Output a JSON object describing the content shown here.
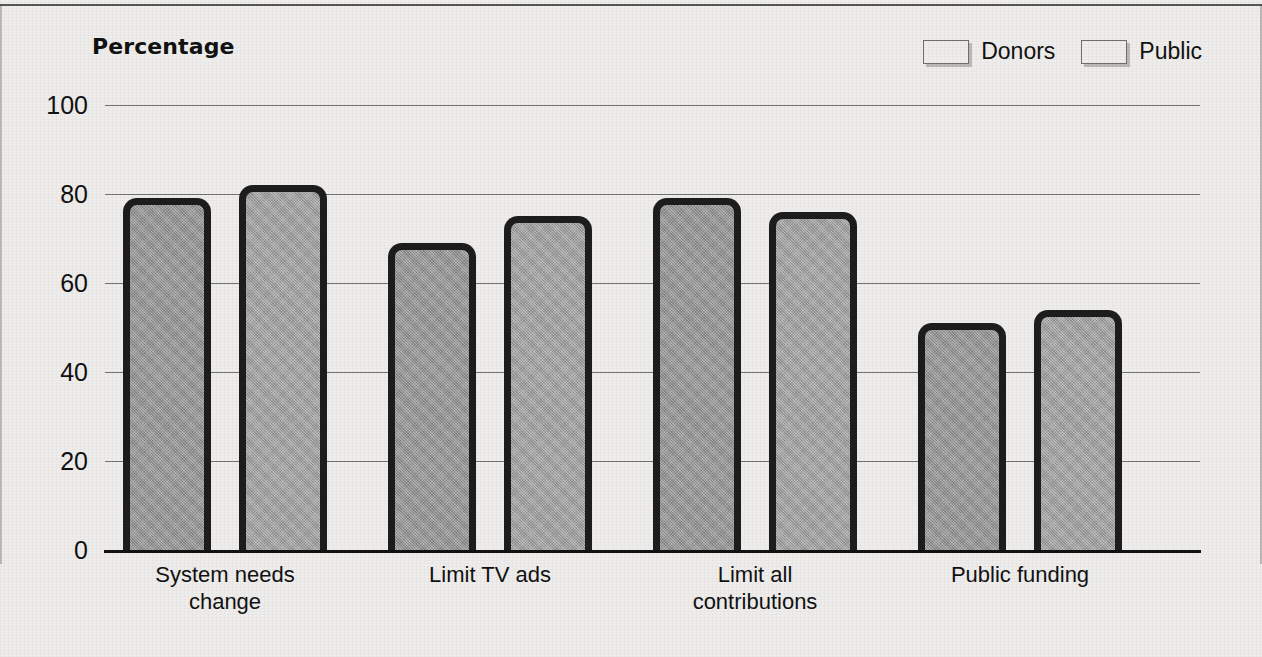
{
  "chart_data": {
    "type": "bar",
    "title": "",
    "ylabel": "Percentage",
    "xlabel": "",
    "ylim": [
      0,
      100
    ],
    "yticks": [
      "0",
      "20",
      "40",
      "60",
      "80",
      "100"
    ],
    "grid": true,
    "legend_position": "top-right",
    "categories": [
      "System needs\nchange",
      "Limit TV ads",
      "Limit all\ncontributions",
      "Public funding"
    ],
    "category_lines": [
      [
        "System needs",
        "change"
      ],
      [
        "Limit TV ads",
        ""
      ],
      [
        "Limit all",
        "contributions"
      ],
      [
        "Public funding",
        ""
      ]
    ],
    "series": [
      {
        "name": "Donors",
        "color": "#9b9b9b",
        "values": [
          79,
          69,
          79,
          51
        ]
      },
      {
        "name": "Public",
        "color": "#a8a8a8",
        "values": [
          82,
          75,
          76,
          54
        ]
      }
    ]
  },
  "legend": {
    "items": [
      {
        "label": "Donors"
      },
      {
        "label": "Public"
      }
    ]
  },
  "axis": {
    "title": "Percentage"
  }
}
